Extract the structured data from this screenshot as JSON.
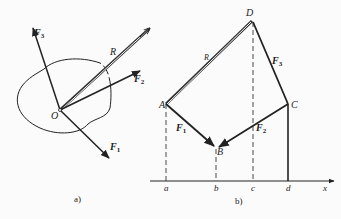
{
  "figure_a": {
    "caption": "a)",
    "origin_label": "O",
    "resultant_label": "R",
    "forces": [
      {
        "label": "F",
        "sub": "1"
      },
      {
        "label": "F",
        "sub": "2"
      },
      {
        "label": "F",
        "sub": "3"
      }
    ]
  },
  "figure_b": {
    "caption": "b)",
    "points": [
      "A",
      "B",
      "C",
      "D"
    ],
    "axis_ticks": [
      "a",
      "b",
      "c",
      "d"
    ],
    "axis_label": "x",
    "resultant_label": "R",
    "forces": [
      {
        "label": "F",
        "sub": "1"
      },
      {
        "label": "F",
        "sub": "2"
      },
      {
        "label": "F",
        "sub": "3"
      }
    ]
  }
}
